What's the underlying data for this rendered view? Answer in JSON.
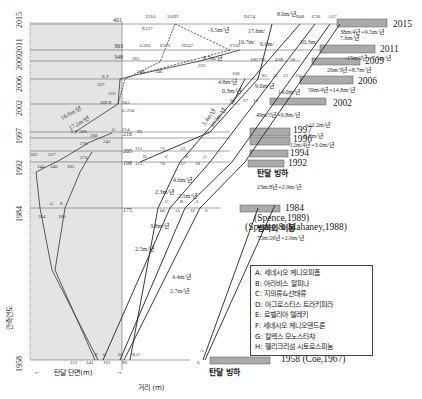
{
  "figure": {
    "y_axis_label": "관측연도",
    "x_axis_label": "거리 (m)",
    "left_region_label": "탄달 단면(m)",
    "years": [
      "1958",
      "1984",
      "1992",
      "1997",
      "2002",
      "2006",
      "2009",
      "2011",
      "2015"
    ],
    "left_scale_values": {
      "y2015": "401",
      "y2011": "363",
      "y2009": "348",
      "y1996": "216",
      "y1994": "205",
      "y1992": "198",
      "y1984": "175"
    },
    "glacier_bars": [
      {
        "year": "2015",
        "rate": "38m/4년=9.5m/년"
      },
      {
        "year": "2011",
        "rate": "15m/2년=7.5m/년"
      },
      {
        "year": "2009",
        "rate": "26m/3년=8.7m/년"
      },
      {
        "year": "2006",
        "rate": "59m/4년=14.8m/년"
      },
      {
        "year": "2002",
        "rate": "49m/5년=9.8m/년"
      },
      {
        "year": "1997",
        "rate": "12.2m/년"
      },
      {
        "year": "1996",
        "rate": "8.8m/년"
      },
      {
        "year": "1994",
        "rate": "12m/4년=3.0m/년"
      },
      {
        "year": "1992",
        "rate": ""
      },
      {
        "year": "1984",
        "rate": "23m/8년=2.9m/년"
      },
      {
        "year": "1958",
        "rate": ""
      }
    ],
    "glacier_label_1992": "탄달 빙하",
    "glacier_label_1958": "탄달 빙하",
    "citation_1984a": "(Spence,1989)",
    "citation_1984b": "(Spence & Mahaney,1988)",
    "citation_1958": "1958 (Coe,1967)",
    "glacier_movement_title": "빙하의 이동",
    "glacier_movement_rate": "75m/26년=2.9m/년",
    "rate_labels": [
      "16.0m/년",
      "17.2m/년",
      "8.0m/년",
      "17.6m/",
      "10.7m/",
      "6.0m/",
      "10.3m/",
      "-3.5m/년",
      "8.7m/년",
      "4.8m/년",
      "0.3m/년",
      "9.0m/년",
      "14.0m/년",
      "5.4m/년",
      "10.2m/년",
      "7.6m/년",
      "4.6m/년",
      "2.3m/년",
      "2.1m/년",
      "3.8m/년",
      "2.5m/년",
      "4.4m/년",
      "2.7m/년"
    ],
    "legend": [
      "A: 세네시오 케니오피폼",
      "B: 아라비스 알피나",
      "C: 지의류&선태류",
      "D: 아그로스티스 트라키피라",
      "E: 로벨리아 텔레키",
      "F: 세네시오 케니오덴드론",
      "G: 칼렉스 모노스타챠",
      "H: 헬리크리섬 시토로스피눔"
    ],
    "point_labels_top": [
      "331G",
      "316H",
      "E337",
      "D174",
      "B48",
      "C26",
      "A17",
      "G282",
      "E275",
      "H247",
      "F162",
      "265",
      "248",
      "246",
      "232",
      "100",
      "79C",
      "43B",
      "18",
      "100",
      "85",
      "35",
      "15",
      "12",
      "60",
      "27",
      "12"
    ],
    "point_labels_left": [
      "E,F 300",
      "269 E",
      "263",
      "G 256",
      "G 214",
      "276",
      "268",
      "242",
      "274",
      "327",
      "362",
      "340",
      "344",
      "305",
      "304",
      "300",
      "151",
      "141",
      "101",
      "90",
      "6"
    ]
  }
}
